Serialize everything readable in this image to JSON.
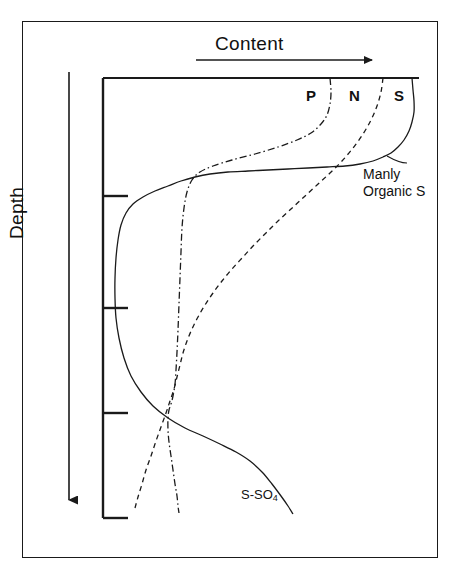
{
  "figure": {
    "title_axis_x": "Content",
    "title_axis_y": "Depth",
    "background_color": "#ffffff",
    "line_color": "#1a1a1a"
  },
  "labels": {
    "p": "P",
    "n": "N",
    "s": "S",
    "manly_line1": "Manly",
    "manly_line2": "Organic S",
    "sso4_main": "S-SO",
    "sso4_sub": "4"
  },
  "chart_data": {
    "type": "line",
    "title": "Content",
    "xlabel": "Content",
    "ylabel": "Depth",
    "orientation": "depth-profile (x = content increasing right, y = depth increasing downward)",
    "grid": false,
    "legend": "inline-labels",
    "axis": {
      "x_axis_line_y": 78,
      "x_axis_x_range": [
        103,
        419
      ],
      "y_axis_line_x": 103,
      "y_axis_y_range": [
        78,
        518
      ],
      "y_ticks_px": [
        196,
        308,
        413,
        518
      ],
      "x_arrow": {
        "from": [
          196,
          60
        ],
        "to": [
          375,
          60
        ],
        "direction": "right"
      },
      "y_arrow": {
        "from": [
          69,
          72
        ],
        "to": [
          69,
          505
        ],
        "direction": "down"
      }
    },
    "series": [
      {
        "name": "P",
        "label": "P",
        "style": "dash-dot",
        "points_px": [
          [
            330,
            78
          ],
          [
            331,
            92
          ],
          [
            330,
            104
          ],
          [
            327,
            115
          ],
          [
            321,
            124
          ],
          [
            311,
            133
          ],
          [
            297,
            140
          ],
          [
            278,
            147
          ],
          [
            255,
            154
          ],
          [
            232,
            160
          ],
          [
            213,
            166
          ],
          [
            200,
            172
          ],
          [
            192,
            180
          ],
          [
            187,
            192
          ],
          [
            184,
            208
          ],
          [
            182,
            228
          ],
          [
            181,
            252
          ],
          [
            180,
            278
          ],
          [
            179,
            304
          ],
          [
            178,
            330
          ],
          [
            177,
            352
          ],
          [
            176,
            370
          ],
          [
            175,
            384
          ],
          [
            173,
            396
          ],
          [
            171,
            404
          ],
          [
            169,
            410
          ],
          [
            168,
            418
          ],
          [
            168,
            430
          ],
          [
            169,
            442
          ],
          [
            171,
            456
          ],
          [
            173,
            470
          ],
          [
            175,
            484
          ],
          [
            177,
            496
          ],
          [
            178,
            506
          ],
          [
            179,
            513
          ]
        ]
      },
      {
        "name": "N",
        "label": "N",
        "style": "dashed",
        "points_px": [
          [
            383,
            78
          ],
          [
            381,
            92
          ],
          [
            377,
            106
          ],
          [
            371,
            120
          ],
          [
            363,
            134
          ],
          [
            353,
            148
          ],
          [
            342,
            161
          ],
          [
            330,
            173
          ],
          [
            317,
            185
          ],
          [
            304,
            197
          ],
          [
            291,
            209
          ],
          [
            278,
            221
          ],
          [
            266,
            233
          ],
          [
            254,
            245
          ],
          [
            243,
            257
          ],
          [
            232,
            269
          ],
          [
            222,
            281
          ],
          [
            213,
            293
          ],
          [
            205,
            305
          ],
          [
            198,
            317
          ],
          [
            192,
            329
          ],
          [
            187,
            341
          ],
          [
            183,
            353
          ],
          [
            180,
            365
          ],
          [
            177,
            377
          ],
          [
            174,
            389
          ],
          [
            170,
            401
          ],
          [
            166,
            413
          ],
          [
            161,
            427
          ],
          [
            156,
            441
          ],
          [
            151,
            456
          ],
          [
            146,
            470
          ],
          [
            142,
            484
          ],
          [
            138,
            497
          ],
          [
            135,
            508
          ]
        ]
      },
      {
        "name": "S",
        "label": "S",
        "style": "solid",
        "points_px": [
          [
            412,
            78
          ],
          [
            413,
            90
          ],
          [
            414,
            101
          ],
          [
            414,
            112
          ],
          [
            412,
            122
          ],
          [
            409,
            131
          ],
          [
            404,
            140
          ],
          [
            398,
            147
          ],
          [
            391,
            153
          ],
          [
            383,
            157
          ],
          [
            373,
            161
          ],
          [
            360,
            164
          ],
          [
            345,
            166
          ],
          [
            327,
            167
          ],
          [
            308,
            168
          ],
          [
            288,
            169
          ],
          [
            268,
            170
          ],
          [
            248,
            171
          ],
          [
            228,
            172
          ],
          [
            210,
            174
          ],
          [
            195,
            177
          ],
          [
            181,
            181
          ],
          [
            168,
            186
          ],
          [
            155,
            191
          ],
          [
            143,
            197
          ],
          [
            133,
            204
          ],
          [
            126,
            213
          ],
          [
            121,
            225
          ],
          [
            118,
            240
          ],
          [
            116,
            258
          ],
          [
            115,
            278
          ],
          [
            115,
            298
          ],
          [
            116,
            318
          ],
          [
            119,
            338
          ],
          [
            124,
            358
          ],
          [
            131,
            376
          ],
          [
            141,
            392
          ],
          [
            153,
            406
          ],
          [
            168,
            418
          ],
          [
            185,
            428
          ],
          [
            203,
            436
          ],
          [
            220,
            444
          ],
          [
            236,
            452
          ],
          [
            250,
            461
          ],
          [
            262,
            472
          ],
          [
            272,
            484
          ],
          [
            281,
            496
          ],
          [
            288,
            506
          ],
          [
            293,
            514
          ]
        ]
      }
    ],
    "annotations": [
      {
        "text": "Manly Organic S",
        "target_series": "S",
        "position_px": [
          363,
          166
        ]
      },
      {
        "text": "S-SO4",
        "target_series": "S",
        "position_px": [
          241,
          487
        ]
      }
    ]
  }
}
